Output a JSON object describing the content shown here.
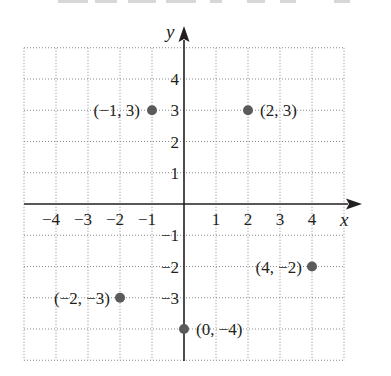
{
  "chart_data": {
    "type": "scatter",
    "title": "",
    "xlabel": "x",
    "ylabel": "y",
    "xlim": [
      -5,
      5
    ],
    "ylim": [
      -5,
      5
    ],
    "grid": true,
    "grid_style": "dotted",
    "x_ticks": [
      -4,
      -3,
      -2,
      -1,
      1,
      2,
      3,
      4
    ],
    "y_ticks": [
      4,
      3,
      2,
      1,
      -1,
      -2,
      -3,
      -4
    ],
    "x_tick_labels": [
      "−4",
      "−3",
      "−2",
      "−1",
      "1",
      "2",
      "3",
      "4"
    ],
    "y_tick_labels": [
      "4",
      "3",
      "2",
      "1",
      "−1",
      "−2",
      "−3"
    ],
    "points": [
      {
        "x": -1,
        "y": 3,
        "label": "(−1, 3)"
      },
      {
        "x": 2,
        "y": 3,
        "label": "(2, 3)"
      },
      {
        "x": 4,
        "y": -2,
        "label": "(4, −2)"
      },
      {
        "x": -2,
        "y": -3,
        "label": "(−2, −3)"
      },
      {
        "x": 0,
        "y": -4,
        "label": "(0, −4)"
      }
    ],
    "colors": {
      "point": "#5a5a5a",
      "axis": "#231f20",
      "grid": "#8a8a8a",
      "text": "#231f20"
    }
  }
}
